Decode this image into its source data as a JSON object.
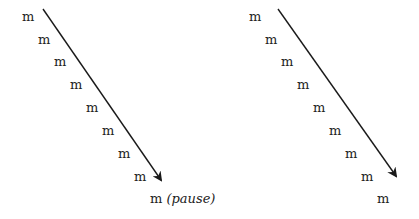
{
  "left_diagram": {
    "syllables": [
      "m",
      "m",
      "m",
      "m",
      "m",
      "m",
      "m",
      "m",
      "m"
    ],
    "final_annotation": "(pause)",
    "arrow": {
      "x1": 43,
      "y1": 9,
      "x2": 161,
      "y2": 180
    }
  },
  "right_diagram": {
    "syllables": [
      "m",
      "m",
      "m",
      "m",
      "m",
      "m",
      "m",
      "m",
      "m"
    ],
    "arrow": {
      "x1": 278,
      "y1": 9,
      "x2": 396,
      "y2": 176
    }
  },
  "colors": {
    "text": "#222222",
    "arrow": "#1a1a1a",
    "background": "#ffffff"
  }
}
